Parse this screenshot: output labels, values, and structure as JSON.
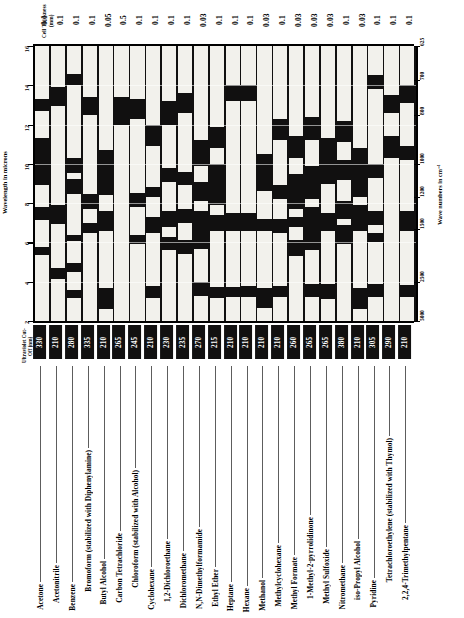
{
  "headers": {
    "cell_thickness_title": "Cell Thickness (mm)",
    "uv_cutoff_title": "Ultraviolet Cut-Off (nm)",
    "wavelength_axis_title": "Wavelength in microns",
    "wavenumber_axis_title": "Wave numbers in cm⁻¹"
  },
  "axes": {
    "wavelength_ticks": [
      "16",
      "14",
      "12",
      "10",
      "8",
      "6",
      "4",
      "2"
    ],
    "wavenumber_ticks": [
      "625",
      "700",
      "800",
      "1000",
      "1200",
      "1500",
      "2500",
      "5000"
    ],
    "wavelength_range": [
      2,
      16
    ],
    "wavenumber_range": [
      625,
      5000
    ]
  },
  "colors": {
    "absorbing": "#111010",
    "transmitting": "#f2f1ec",
    "ink": "#000000",
    "leader": "#5d5d5d"
  },
  "chart_data": {
    "type": "heatmap",
    "xlabel": "",
    "ylabel": "Wavelength in microns",
    "grid": true,
    "legend": "none",
    "ylim": [
      2,
      16
    ],
    "categories": [
      "Acetone",
      "Acetonitrile",
      "Benzene",
      "Bromoform (stabilized with Diphenylamine)",
      "Butyl Alcohol",
      "Carbon Tetrachloride",
      "Chloroform (stabilized with Alcohol)",
      "Cyclohexane",
      "1,2-Dichloroethane",
      "Dichloromethane",
      "N,N-Dimethylformamide",
      "Ethyl Ether",
      "Heptane",
      "Hexane",
      "Methanol",
      "Methylcyclohexane",
      "Methyl Formate",
      "1-Methyl-2-pyrrolidinone",
      "Methyl Sulfoxide",
      "Nitromethane",
      "iso-Propyl Alcohol",
      "Pyridine",
      "Tetrachloroethylene (stabilized with Thymol)",
      "2,2,4-Trimethylpentane"
    ],
    "cell_thickness_mm": [
      "0.1",
      "0.1",
      "0.1",
      "0.1",
      "0.05",
      "0.5",
      "0.1",
      "0.1",
      "0.1",
      "0.1",
      "0.03",
      "0.1",
      "0.1",
      "0.1",
      "0.03",
      "0.1",
      "0.03",
      "0.03",
      "0.03",
      "0.1",
      "0.03",
      "0.1",
      "0.1",
      "0.1"
    ],
    "uv_cutoff_nm": [
      "330",
      "210",
      "280",
      "335",
      "210",
      "265",
      "245",
      "210",
      "230",
      "235",
      "270",
      "215",
      "210",
      "210",
      "210",
      "210",
      "260",
      "265",
      "265",
      "380",
      "210",
      "305",
      "290",
      "210"
    ],
    "series": [
      {
        "name": "Acetone",
        "transmitting_microns": [
          [
            2.0,
            5.35
          ],
          [
            5.75,
            7.15
          ],
          [
            7.8,
            8.9
          ],
          [
            11.3,
            12.7
          ],
          [
            13.3,
            16.0
          ]
        ]
      },
      {
        "name": "Acetonitrile",
        "transmitting_microns": [
          [
            2.0,
            4.15
          ],
          [
            4.7,
            6.95
          ],
          [
            7.9,
            12.95
          ],
          [
            13.9,
            16.0
          ]
        ]
      },
      {
        "name": "Benzene",
        "transmitting_microns": [
          [
            2.0,
            3.15
          ],
          [
            3.6,
            4.5
          ],
          [
            4.95,
            6.05
          ],
          [
            6.4,
            8.45
          ],
          [
            9.25,
            9.55
          ],
          [
            10.3,
            14.0
          ],
          [
            14.6,
            16.0
          ]
        ]
      },
      {
        "name": "Bromoform (stabilized with Diphenylamine)",
        "transmitting_microns": [
          [
            2.0,
            6.5
          ],
          [
            7.0,
            7.7
          ],
          [
            8.45,
            12.5
          ],
          [
            13.4,
            16.0
          ]
        ]
      },
      {
        "name": "Butyl Alcohol",
        "transmitting_microns": [
          [
            2.0,
            2.6
          ],
          [
            3.7,
            6.6
          ],
          [
            7.6,
            8.4
          ],
          [
            10.7,
            16.0
          ]
        ]
      },
      {
        "name": "Carbon Tetrachloride",
        "transmitting_microns": [
          [
            2.0,
            12.0
          ],
          [
            13.4,
            16.0
          ]
        ]
      },
      {
        "name": "Chloroform (stabilized with Alcohol)",
        "transmitting_microns": [
          [
            2.0,
            5.9
          ],
          [
            6.4,
            7.8
          ],
          [
            8.5,
            12.3
          ],
          [
            13.3,
            16.0
          ]
        ]
      },
      {
        "name": "Cyclohexane",
        "transmitting_microns": [
          [
            2.0,
            3.15
          ],
          [
            3.8,
            6.5
          ],
          [
            7.3,
            8.3
          ],
          [
            8.8,
            10.9
          ],
          [
            12.0,
            16.0
          ]
        ]
      },
      {
        "name": "1,2-Dichloroethane",
        "transmitting_microns": [
          [
            2.0,
            5.6
          ],
          [
            6.3,
            6.8
          ],
          [
            7.6,
            9.1
          ],
          [
            9.8,
            12.0
          ],
          [
            13.2,
            16.0
          ]
        ]
      },
      {
        "name": "Dichloromethane",
        "transmitting_microns": [
          [
            2.0,
            5.4
          ],
          [
            6.1,
            7.0
          ],
          [
            7.7,
            8.9
          ],
          [
            9.6,
            12.6
          ],
          [
            13.6,
            16.0
          ]
        ]
      },
      {
        "name": "N,N-Dimethylformamide",
        "transmitting_microns": [
          [
            2.0,
            3.25
          ],
          [
            4.0,
            5.65
          ],
          [
            7.6,
            8.1
          ],
          [
            9.1,
            9.9
          ],
          [
            11.2,
            16.0
          ]
        ]
      },
      {
        "name": "Ethyl Ether",
        "transmitting_microns": [
          [
            2.0,
            3.15
          ],
          [
            3.75,
            6.6
          ],
          [
            7.4,
            7.9
          ],
          [
            10.0,
            10.8
          ],
          [
            11.9,
            16.0
          ]
        ]
      },
      {
        "name": "Heptane",
        "transmitting_microns": [
          [
            2.0,
            3.2
          ],
          [
            3.75,
            6.6
          ],
          [
            7.5,
            13.2
          ],
          [
            14.0,
            16.0
          ]
        ]
      },
      {
        "name": "Hexane",
        "transmitting_microns": [
          [
            2.0,
            3.2
          ],
          [
            3.8,
            6.6
          ],
          [
            7.5,
            13.2
          ],
          [
            14.0,
            16.0
          ]
        ]
      },
      {
        "name": "Methanol",
        "transmitting_microns": [
          [
            2.0,
            2.65
          ],
          [
            3.7,
            6.6
          ],
          [
            7.2,
            8.6
          ],
          [
            10.5,
            16.0
          ]
        ]
      },
      {
        "name": "Methylcyclohexane",
        "transmitting_microns": [
          [
            2.0,
            3.2
          ],
          [
            3.8,
            6.5
          ],
          [
            7.2,
            8.2
          ],
          [
            8.9,
            11.2
          ],
          [
            12.3,
            16.0
          ]
        ]
      },
      {
        "name": "Methyl Formate",
        "transmitting_microns": [
          [
            2.0,
            5.3
          ],
          [
            6.1,
            6.8
          ],
          [
            7.3,
            7.7
          ],
          [
            9.5,
            10.3
          ],
          [
            11.4,
            16.0
          ]
        ]
      },
      {
        "name": "1-Methyl-2-pyrrolidinone",
        "transmitting_microns": [
          [
            2.0,
            3.2
          ],
          [
            3.9,
            5.6
          ],
          [
            7.8,
            8.2
          ],
          [
            9.9,
            11.2
          ],
          [
            12.4,
            16.0
          ]
        ]
      },
      {
        "name": "Methyl Sulfoxide",
        "transmitting_microns": [
          [
            2.0,
            3.1
          ],
          [
            3.9,
            6.6
          ],
          [
            7.5,
            9.0
          ],
          [
            11.3,
            16.0
          ]
        ]
      },
      {
        "name": "Nitromethane",
        "transmitting_microns": [
          [
            2.0,
            5.9
          ],
          [
            6.9,
            7.2
          ],
          [
            8.1,
            9.2
          ],
          [
            10.2,
            11.1
          ],
          [
            12.2,
            16.0
          ]
        ]
      },
      {
        "name": "iso-Propyl Alcohol",
        "transmitting_microns": [
          [
            2.0,
            2.6
          ],
          [
            3.7,
            6.6
          ],
          [
            7.9,
            8.3
          ],
          [
            10.8,
            16.0
          ]
        ]
      },
      {
        "name": "Pyridine",
        "transmitting_microns": [
          [
            2.0,
            3.2
          ],
          [
            3.9,
            6.0
          ],
          [
            6.5,
            6.9
          ],
          [
            7.6,
            9.3
          ],
          [
            10.0,
            13.8
          ],
          [
            14.5,
            16.0
          ]
        ]
      },
      {
        "name": "Tetrachloroethylene (stabilized with Thymol)",
        "transmitting_microns": [
          [
            2.0,
            10.3
          ],
          [
            11.4,
            12.6
          ],
          [
            13.5,
            16.0
          ]
        ]
      },
      {
        "name": "2,2,4-Trimethylpentane",
        "transmitting_microns": [
          [
            2.0,
            3.2
          ],
          [
            3.85,
            6.6
          ],
          [
            7.6,
            10.2
          ],
          [
            10.9,
            13.1
          ],
          [
            14.0,
            16.0
          ]
        ]
      }
    ]
  }
}
